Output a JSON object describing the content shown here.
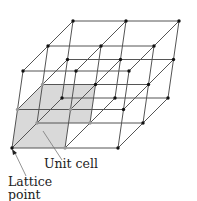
{
  "figure": {
    "labels": {
      "unit_cell": "Unit cell",
      "lattice_point_line1": "Lattice",
      "lattice_point_line2": "point"
    },
    "lattice": {
      "origin": [
        12,
        148
      ],
      "a": [
        26.5,
        0
      ],
      "b": [
        12.5,
        -12.5
      ],
      "c": [
        2.75,
        -19.25
      ],
      "counts": [
        3,
        3,
        3
      ],
      "line_color": "#555555",
      "point_color": "#111111",
      "unit_cell_fill": "#d9d9d9"
    }
  }
}
